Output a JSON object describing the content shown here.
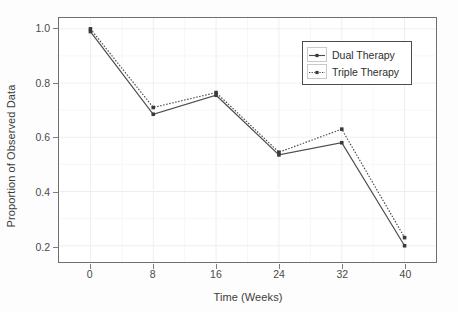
{
  "chart_data": {
    "type": "line",
    "title": "",
    "xlabel": "Time (Weeks)",
    "ylabel": "Proportion of Observed Data",
    "x": [
      0,
      8,
      16,
      24,
      32,
      40
    ],
    "xtick_labels": [
      "0",
      "8",
      "16",
      "24",
      "32",
      "40"
    ],
    "ytick_labels": [
      "0.2",
      "0.4",
      "0.6",
      "0.8",
      "1.0"
    ],
    "ytick_values": [
      0.2,
      0.4,
      0.6,
      0.8,
      1.0
    ],
    "xlim": [
      -4,
      44
    ],
    "ylim": [
      0.14,
      1.04
    ],
    "grid": true,
    "legend_position": "top-right",
    "series": [
      {
        "name": "Dual Therapy",
        "values": [
          0.99,
          0.685,
          0.755,
          0.535,
          0.58,
          0.2
        ],
        "line_style": "solid",
        "color": "#4d4d4d",
        "marker": "square"
      },
      {
        "name": "Triple Therapy",
        "values": [
          1.0,
          0.71,
          0.765,
          0.545,
          0.63,
          0.23
        ],
        "line_style": "dotted",
        "color": "#4d4d4d",
        "marker": "square"
      }
    ]
  },
  "legend": {
    "entries": [
      {
        "label": "Dual Therapy"
      },
      {
        "label": "Triple Therapy"
      }
    ]
  },
  "colors": {
    "series_line": "#4d4d4d",
    "panel_border": "#6f6f6f",
    "grid_major": "#eceff2",
    "grid_minor": "#f5f7f8",
    "text": "#3c3c3c",
    "background": "#fdfdfd"
  }
}
